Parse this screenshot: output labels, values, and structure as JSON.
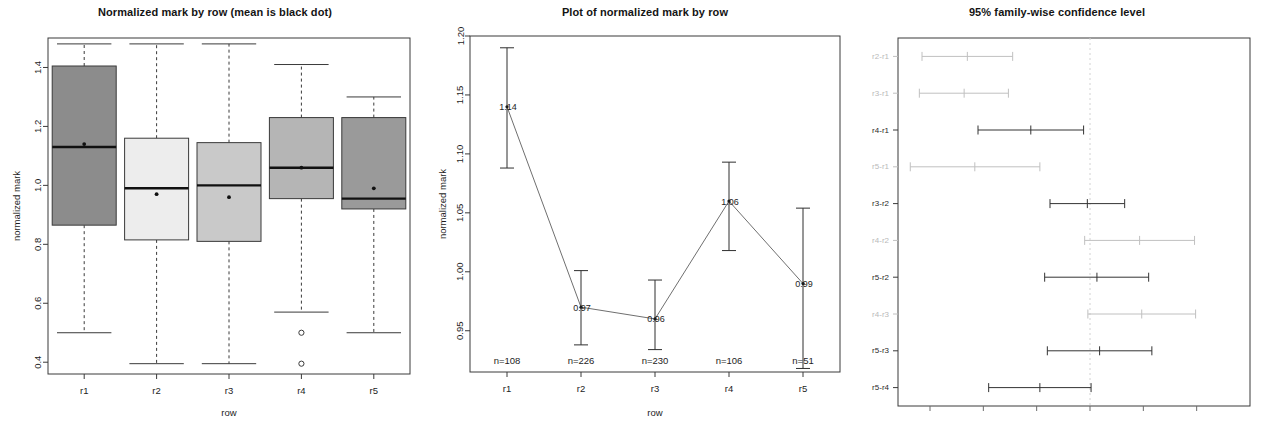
{
  "panels": {
    "box": {
      "title": "Normalized mark by row (mean is black dot)",
      "xlabel": "row",
      "ylabel": "normalized mark"
    },
    "line": {
      "title": "Plot of normalized mark by row",
      "xlabel": "row",
      "ylabel": "normalized mark"
    },
    "ci": {
      "title": "95% family-wise confidence level"
    }
  },
  "chart_data": [
    {
      "type": "box",
      "title": "Normalized mark by row (mean is black dot)",
      "xlabel": "row",
      "ylabel": "normalized mark",
      "categories": [
        "r1",
        "r2",
        "r3",
        "r4",
        "r5"
      ],
      "ylim": [
        0.36,
        1.5
      ],
      "yticks": [
        "0.4",
        "0.6",
        "0.8",
        "1.0",
        "1.2",
        "1.4"
      ],
      "ytickvals": [
        0.4,
        0.6,
        0.8,
        1.0,
        1.2,
        1.4
      ],
      "grid": false,
      "boxes": [
        {
          "category": "r1",
          "lower_whisker": 0.5,
          "q1": 0.865,
          "median": 1.13,
          "q3": 1.405,
          "upper_whisker": 1.48,
          "mean": 1.14,
          "fill": "#8c8c8c",
          "outliers": []
        },
        {
          "category": "r2",
          "lower_whisker": 0.395,
          "q1": 0.815,
          "median": 0.99,
          "q3": 1.16,
          "upper_whisker": 1.48,
          "mean": 0.97,
          "fill": "#ededed",
          "outliers": []
        },
        {
          "category": "r3",
          "lower_whisker": 0.395,
          "q1": 0.81,
          "median": 1.0,
          "q3": 1.145,
          "upper_whisker": 1.48,
          "mean": 0.96,
          "fill": "#c9c9c9",
          "outliers": []
        },
        {
          "category": "r4",
          "lower_whisker": 0.57,
          "q1": 0.955,
          "median": 1.06,
          "q3": 1.23,
          "upper_whisker": 1.41,
          "mean": 1.06,
          "fill": "#b5b5b5",
          "outliers": [
            0.5,
            0.395
          ]
        },
        {
          "category": "r5",
          "lower_whisker": 0.5,
          "q1": 0.92,
          "median": 0.955,
          "q3": 1.23,
          "upper_whisker": 1.3,
          "mean": 0.99,
          "fill": "#9a9a9a",
          "outliers": []
        }
      ]
    },
    {
      "type": "line",
      "title": "Plot of normalized mark by row",
      "xlabel": "row",
      "ylabel": "normalized mark",
      "categories": [
        "r1",
        "r2",
        "r3",
        "r4",
        "r5"
      ],
      "values": [
        1.14,
        0.97,
        0.96,
        1.06,
        0.99
      ],
      "value_labels": [
        "1.14",
        "0.97",
        "0.96",
        "1.06",
        "0.99"
      ],
      "ci_low": [
        1.088,
        0.938,
        0.934,
        1.018,
        0.918
      ],
      "ci_high": [
        1.19,
        1.001,
        0.993,
        1.093,
        1.054
      ],
      "n_labels": [
        "n=108",
        "n=226",
        "n=230",
        "n=106",
        "n=51"
      ],
      "n_values": [
        108,
        226,
        230,
        106,
        51
      ],
      "ylim": [
        0.915,
        1.2
      ],
      "yticks": [
        "0.95",
        "1.00",
        "1.05",
        "1.10",
        "1.15",
        "1.20"
      ],
      "ytickvals": [
        0.95,
        1.0,
        1.05,
        1.1,
        1.15,
        1.2
      ],
      "grid": false
    },
    {
      "type": "ci",
      "title": "95% family-wise confidence level",
      "xlim": [
        -0.36,
        0.3
      ],
      "zero_line": 0.0,
      "grid": false,
      "comparisons": [
        {
          "label": "r2-r1",
          "lower": -0.315,
          "upper": -0.145,
          "center": -0.23,
          "faint": true
        },
        {
          "label": "r3-r1",
          "lower": -0.32,
          "upper": -0.153,
          "center": -0.236,
          "faint": true
        },
        {
          "label": "r4-r1",
          "lower": -0.21,
          "upper": -0.012,
          "center": -0.111,
          "faint": false
        },
        {
          "label": "r5-r1",
          "lower": -0.337,
          "upper": -0.094,
          "center": -0.216,
          "faint": true
        },
        {
          "label": "r3-r2",
          "lower": -0.075,
          "upper": 0.065,
          "center": -0.005,
          "faint": false
        },
        {
          "label": "r4-r2",
          "lower": -0.01,
          "upper": 0.196,
          "center": 0.093,
          "faint": true
        },
        {
          "label": "r5-r2",
          "lower": -0.085,
          "upper": 0.11,
          "center": 0.013,
          "faint": false
        },
        {
          "label": "r4-r3",
          "lower": -0.004,
          "upper": 0.198,
          "center": 0.097,
          "faint": true
        },
        {
          "label": "r5-r3",
          "lower": -0.08,
          "upper": 0.116,
          "center": 0.018,
          "faint": false
        },
        {
          "label": "r5-r4",
          "lower": -0.19,
          "upper": 0.002,
          "center": -0.094,
          "faint": false
        }
      ]
    }
  ]
}
